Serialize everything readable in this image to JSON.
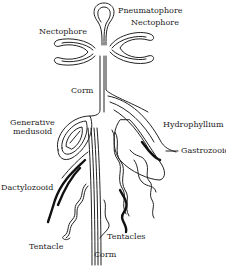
{
  "figure": {
    "labels": {
      "pneumatophore": "Pneumatophore",
      "nectophore_right": "Nectophore",
      "nectophore_left": "Nectophore",
      "corm_upper": "Corm",
      "generative_medusoid_line1": "Generative",
      "generative_medusoid_line2": "medusoid",
      "hydrophyllium": "Hydrophyllium",
      "gastrozooid": "Gastrozooid",
      "dactylozooid": "Dactylozooid",
      "tentacle": "Tentacle",
      "tentacles": "Tentacles",
      "corm_lower": "Corm"
    }
  }
}
